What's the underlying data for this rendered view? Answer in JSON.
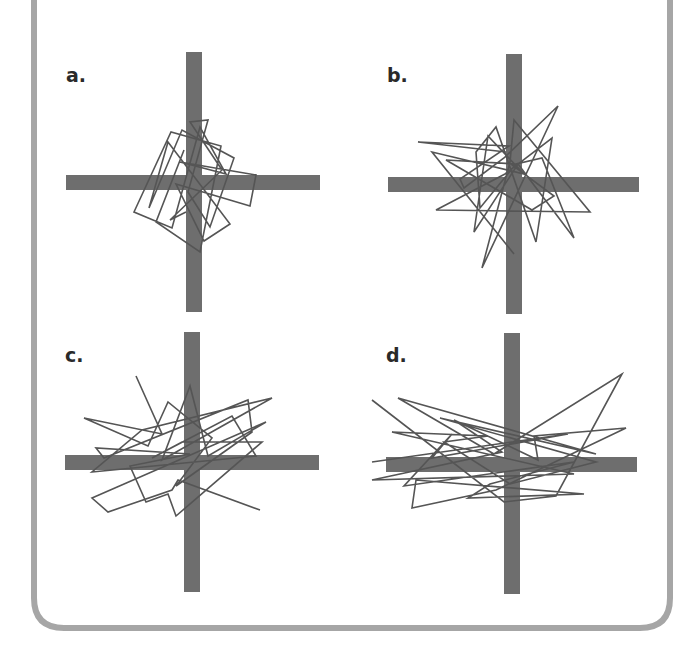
{
  "colors": {
    "border": "#a6a6a6",
    "axis": "#6e6e6e",
    "path": "#555555",
    "background": "#ffffff"
  },
  "panels": [
    {
      "label": "a.",
      "description": "compact random walk, roughly isotropic, slightly elongated vertically",
      "path": [
        [
          -10,
          -32
        ],
        [
          -38,
          40
        ],
        [
          6,
          70
        ],
        [
          27,
          -36
        ],
        [
          -23,
          -50
        ],
        [
          -60,
          30
        ],
        [
          -22,
          46
        ],
        [
          6,
          -55
        ],
        [
          32,
          -8
        ],
        [
          -14,
          -20
        ],
        [
          62,
          -7
        ],
        [
          56,
          24
        ],
        [
          -18,
          2
        ],
        [
          10,
          59
        ],
        [
          36,
          42
        ],
        [
          -26,
          -40
        ],
        [
          -45,
          26
        ],
        [
          -12,
          -52
        ],
        [
          40,
          -24
        ],
        [
          16,
          45
        ],
        [
          -6,
          10
        ],
        [
          14,
          -62
        ],
        [
          -4,
          -60
        ],
        [
          28,
          -12
        ],
        [
          -24,
          38
        ],
        [
          -8,
          30
        ]
      ]
    },
    {
      "label": "b.",
      "description": "wider random walk with large excursions in all directions",
      "path": [
        [
          -8,
          -32
        ],
        [
          -96,
          -42
        ],
        [
          -5,
          -38
        ],
        [
          -54,
          -5
        ],
        [
          -50,
          4
        ],
        [
          -10,
          -26
        ],
        [
          44,
          -78
        ],
        [
          -32,
          84
        ],
        [
          -4,
          -22
        ],
        [
          0,
          -64
        ],
        [
          76,
          28
        ],
        [
          -78,
          26
        ],
        [
          -9,
          -10
        ],
        [
          38,
          -46
        ],
        [
          22,
          58
        ],
        [
          -18,
          -57
        ],
        [
          -38,
          -32
        ],
        [
          -34,
          24
        ],
        [
          2,
          -20
        ],
        [
          -68,
          -24
        ],
        [
          18,
          26
        ],
        [
          40,
          12
        ],
        [
          -2,
          -19
        ],
        [
          28,
          -26
        ],
        [
          60,
          54
        ],
        [
          4,
          -20
        ],
        [
          -40,
          48
        ],
        [
          -26,
          -48
        ],
        [
          10,
          -10
        ],
        [
          -82,
          -32
        ],
        [
          0,
          70
        ]
      ]
    },
    {
      "label": "c.",
      "description": "random walk elongated horizontally",
      "path": [
        [
          -56,
          -86
        ],
        [
          -30,
          -28
        ],
        [
          -108,
          -44
        ],
        [
          -44,
          -16
        ],
        [
          -24,
          -60
        ],
        [
          20,
          -24
        ],
        [
          -16,
          24
        ],
        [
          60,
          -30
        ],
        [
          56,
          -62
        ],
        [
          -88,
          -4
        ],
        [
          -96,
          -14
        ],
        [
          -2,
          -8
        ],
        [
          -62,
          4
        ],
        [
          -46,
          40
        ],
        [
          -24,
          32
        ],
        [
          -16,
          54
        ],
        [
          70,
          -20
        ],
        [
          -10,
          -20
        ],
        [
          -40,
          -4
        ],
        [
          40,
          -46
        ],
        [
          64,
          -6
        ],
        [
          -100,
          10
        ],
        [
          -50,
          -32
        ],
        [
          80,
          -64
        ],
        [
          -30,
          -2
        ],
        [
          -2,
          -76
        ],
        [
          16,
          -6
        ],
        [
          74,
          -40
        ],
        [
          -100,
          36
        ],
        [
          -84,
          50
        ],
        [
          -20,
          28
        ],
        [
          -14,
          18
        ],
        [
          68,
          48
        ]
      ]
    },
    {
      "label": "d.",
      "description": "random walk strongly elongated horizontally",
      "path": [
        [
          -140,
          -64
        ],
        [
          -8,
          38
        ],
        [
          44,
          32
        ],
        [
          110,
          -90
        ],
        [
          -18,
          -10
        ],
        [
          -114,
          -66
        ],
        [
          84,
          -10
        ],
        [
          -72,
          -46
        ],
        [
          84,
          -2
        ],
        [
          -2,
          20
        ],
        [
          -68,
          -22
        ],
        [
          -24,
          -28
        ],
        [
          -120,
          -32
        ],
        [
          62,
          10
        ],
        [
          -140,
          16
        ],
        [
          -10,
          -12
        ],
        [
          -58,
          -44
        ],
        [
          26,
          -4
        ],
        [
          22,
          -28
        ],
        [
          114,
          -36
        ],
        [
          -16,
          26
        ],
        [
          -100,
          44
        ],
        [
          -96,
          16
        ],
        [
          72,
          30
        ],
        [
          -44,
          34
        ],
        [
          -22,
          20
        ],
        [
          62,
          -2
        ],
        [
          -108,
          22
        ],
        [
          -60,
          -30
        ],
        [
          -80,
          -6
        ],
        [
          56,
          -30
        ],
        [
          -140,
          -2
        ]
      ]
    }
  ]
}
